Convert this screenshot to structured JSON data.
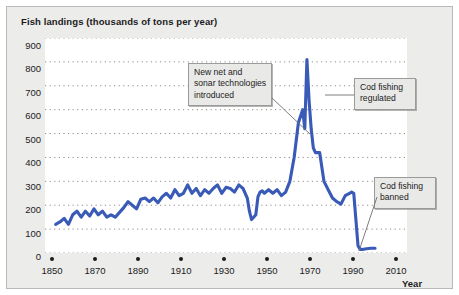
{
  "title": "Fish landings (thousands of tons per year)",
  "axes": {
    "xlabel": "Year",
    "yticks": [
      "900",
      "800",
      "700",
      "600",
      "500",
      "400",
      "300",
      "200",
      "100",
      "0"
    ],
    "xticks": [
      "1850",
      "1870",
      "1890",
      "1910",
      "1930",
      "1950",
      "1970",
      "1990",
      "2010"
    ]
  },
  "annotations": [
    {
      "id": "new-net-sonar",
      "lines": [
        "New net and",
        "sonar technologies",
        "introduced"
      ]
    },
    {
      "id": "cod-regulated",
      "lines": [
        "Cod fishing",
        "regulated"
      ]
    },
    {
      "id": "cod-banned",
      "lines": [
        "Cod fishing",
        "banned"
      ]
    }
  ],
  "colors": {
    "series": "#3a5ab8",
    "figure_background": "#ececeb",
    "plot_background": "#ffffff",
    "grid": "#8d8d8b",
    "text": "#1b1b1b",
    "annotation_fill": "#e9e9e7",
    "annotation_border": "#9a9a98"
  },
  "chart_data": {
    "type": "line",
    "title": "Fish landings (thousands of tons per year)",
    "xlabel": "Year",
    "ylabel": "Fish landings (thousands of tons per year)",
    "xlim": [
      1845,
      2015
    ],
    "ylim": [
      0,
      900
    ],
    "ytick_step": 100,
    "grid": "horizontal dotted gridlines at every 100 units",
    "legend": "none",
    "series": [
      {
        "name": "Fish landings",
        "color": "#3a5ab8",
        "x": [
          1850,
          1852,
          1854,
          1856,
          1858,
          1860,
          1862,
          1864,
          1866,
          1868,
          1870,
          1872,
          1874,
          1876,
          1878,
          1880,
          1882,
          1884,
          1886,
          1888,
          1890,
          1892,
          1894,
          1896,
          1898,
          1900,
          1902,
          1904,
          1906,
          1908,
          1910,
          1912,
          1914,
          1916,
          1918,
          1920,
          1922,
          1924,
          1926,
          1928,
          1930,
          1932,
          1934,
          1936,
          1938,
          1940,
          1941,
          1942,
          1943,
          1944,
          1945,
          1946,
          1947,
          1948,
          1950,
          1952,
          1954,
          1956,
          1958,
          1960,
          1962,
          1964,
          1966,
          1967,
          1968,
          1969,
          1970,
          1971,
          1972,
          1974,
          1976,
          1978,
          1980,
          1982,
          1984,
          1986,
          1988,
          1989,
          1990,
          1991,
          1992,
          1993,
          1994,
          1996,
          1998,
          2000
        ],
        "y": [
          120,
          130,
          145,
          120,
          160,
          175,
          150,
          175,
          155,
          185,
          160,
          175,
          150,
          160,
          150,
          170,
          190,
          215,
          200,
          185,
          225,
          230,
          215,
          230,
          210,
          235,
          250,
          230,
          265,
          240,
          250,
          285,
          250,
          270,
          240,
          265,
          250,
          270,
          285,
          250,
          275,
          270,
          255,
          285,
          270,
          230,
          175,
          140,
          150,
          160,
          235,
          255,
          260,
          250,
          265,
          250,
          265,
          240,
          255,
          300,
          400,
          545,
          600,
          520,
          810,
          640,
          520,
          440,
          420,
          420,
          300,
          265,
          230,
          215,
          205,
          240,
          250,
          255,
          250,
          140,
          30,
          15,
          15,
          18,
          20,
          20
        ]
      }
    ],
    "annotations": [
      {
        "text": "New net and sonar technologies introduced",
        "points_to_year": 1960,
        "points_to_value": 400
      },
      {
        "text": "Cod fishing regulated",
        "points_to_year": 1969,
        "points_to_value": 640
      },
      {
        "text": "Cod fishing banned",
        "points_to_year": 1993,
        "points_to_value": 15
      }
    ]
  }
}
